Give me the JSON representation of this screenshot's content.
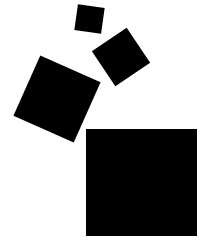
{
  "diagram": {
    "description": "Four black squares on a white background: three tilted squares of increasing size arranged diagonally above-left of a large upright square",
    "background_color": "#ffffff",
    "shape_color": "#000000",
    "shapes": [
      {
        "id": "small",
        "type": "square",
        "center": [
          89,
          19
        ],
        "side": 27,
        "rotation_deg": 8
      },
      {
        "id": "medium",
        "type": "square",
        "center": [
          121,
          57
        ],
        "side": 42,
        "rotation_deg": -34
      },
      {
        "id": "large",
        "type": "square",
        "center": [
          57,
          99
        ],
        "side": 66,
        "rotation_deg": 24
      },
      {
        "id": "base",
        "type": "square",
        "bbox": [
          86,
          129,
          197,
          236
        ],
        "rotation_deg": 0
      }
    ]
  }
}
